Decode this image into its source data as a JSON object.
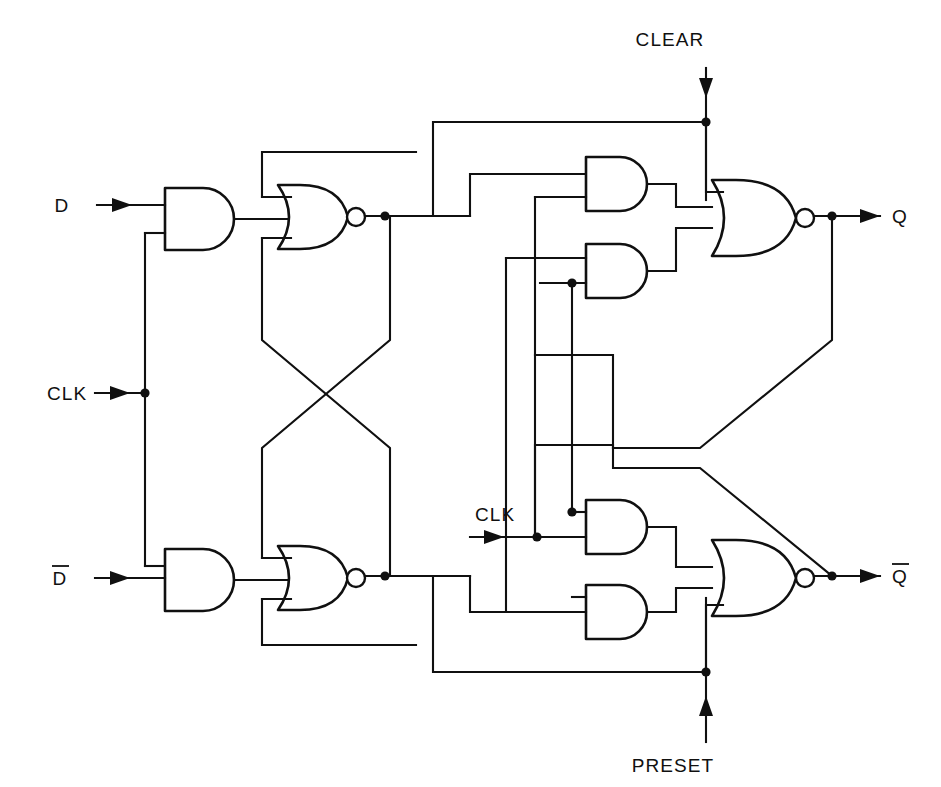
{
  "figure": {
    "type": "logic-circuit-schematic",
    "background_color": "#ffffff",
    "line_color": "#101010"
  },
  "labels": {
    "input_d": "D",
    "input_d_bar": "D",
    "input_clk_left": "CLK",
    "input_clk_right": "CLK",
    "input_clear": "CLEAR",
    "input_preset": "PRESET",
    "output_q": "Q",
    "output_q_bar": "Q"
  },
  "signals": [
    {
      "name": "D",
      "kind": "input",
      "direction": "right",
      "x": 62,
      "y": 212
    },
    {
      "name": "CLK",
      "kind": "input",
      "direction": "right",
      "x": 47,
      "y": 400
    },
    {
      "name": "D-bar",
      "kind": "input",
      "direction": "right",
      "x": 60,
      "y": 585
    },
    {
      "name": "CLEAR",
      "kind": "input",
      "direction": "down",
      "x": 670,
      "y": 46
    },
    {
      "name": "CLK",
      "kind": "input",
      "direction": "right",
      "x": 475,
      "y": 521
    },
    {
      "name": "PRESET",
      "kind": "input",
      "direction": "up",
      "x": 673,
      "y": 758
    },
    {
      "name": "Q",
      "kind": "output",
      "direction": "right",
      "x": 900,
      "y": 222
    },
    {
      "name": "Q-bar",
      "kind": "output",
      "direction": "right",
      "x": 898,
      "y": 582
    }
  ],
  "gates": [
    {
      "id": "and-master-top",
      "type": "AND",
      "inputs": 2,
      "x": 165,
      "y": 188,
      "w": 72,
      "h": 62
    },
    {
      "id": "and-master-bottom",
      "type": "AND",
      "inputs": 2,
      "x": 165,
      "y": 549,
      "w": 72,
      "h": 62
    },
    {
      "id": "nor-master-top",
      "type": "NOR",
      "inputs": 2,
      "x": 278,
      "y": 185,
      "w": 78,
      "h": 64
    },
    {
      "id": "nor-master-bottom",
      "type": "NOR",
      "inputs": 2,
      "x": 278,
      "y": 546,
      "w": 78,
      "h": 64
    },
    {
      "id": "and-slave-q-top",
      "type": "AND",
      "inputs": 2,
      "x": 586,
      "y": 157,
      "w": 66,
      "h": 54
    },
    {
      "id": "and-slave-q-bottom",
      "type": "AND",
      "inputs": 2,
      "x": 586,
      "y": 244,
      "w": 66,
      "h": 54
    },
    {
      "id": "nor-slave-q",
      "type": "NOR",
      "inputs": 3,
      "x": 720,
      "y": 180,
      "w": 78,
      "h": 76
    },
    {
      "id": "and-slave-qbar-top",
      "type": "AND",
      "inputs": 2,
      "x": 586,
      "y": 500,
      "w": 66,
      "h": 54
    },
    {
      "id": "and-slave-qbar-bottom",
      "type": "AND",
      "inputs": 2,
      "x": 586,
      "y": 585,
      "w": 66,
      "h": 54
    },
    {
      "id": "nor-slave-qbar",
      "type": "NOR",
      "inputs": 3,
      "x": 720,
      "y": 540,
      "w": 78,
      "h": 76
    }
  ],
  "junctions": [
    {
      "x": 145,
      "y": 393,
      "on": "clk-bus-left"
    },
    {
      "x": 385,
      "y": 216,
      "on": "master-q-node"
    },
    {
      "x": 385,
      "y": 576,
      "on": "master-qbar-node"
    },
    {
      "x": 706,
      "y": 122,
      "on": "clear-bus"
    },
    {
      "x": 706,
      "y": 672,
      "on": "preset-bus"
    },
    {
      "x": 537,
      "y": 537,
      "on": "clk-right-bus"
    },
    {
      "x": 572,
      "y": 283,
      "on": "q-feedback-tap"
    },
    {
      "x": 572,
      "y": 512,
      "on": "clk-slave-tap"
    },
    {
      "x": 832,
      "y": 216,
      "on": "q-output-node"
    },
    {
      "x": 832,
      "y": 576,
      "on": "qbar-output-node"
    }
  ]
}
